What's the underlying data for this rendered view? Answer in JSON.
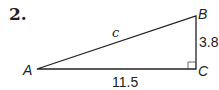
{
  "problem_number": "2.",
  "triangle": {
    "vertices": {
      "A": "A",
      "B": "B",
      "C": "C"
    },
    "hypotenuse_label": "c",
    "side_BC": "3.8",
    "side_AC": "11.5",
    "right_angle_at": "C"
  }
}
